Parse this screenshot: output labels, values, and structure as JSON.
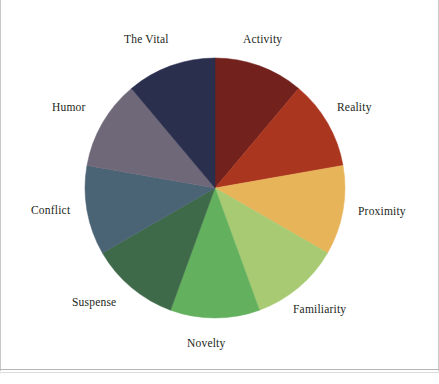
{
  "page": {
    "background_color": "#ffffff",
    "border_color": "#c9c9c9"
  },
  "chart_data": {
    "type": "pie",
    "title": "",
    "subtitle": "",
    "xlabel": "",
    "ylabel": "",
    "legend_position": "labels-around-pie",
    "grid": false,
    "start_angle_deg": 0,
    "direction": "clockwise",
    "equal_slices": true,
    "slice_angle_deg": 40,
    "center": {
      "x": 215,
      "y": 188
    },
    "radius": 130,
    "categories": [
      "Activity",
      "Reality",
      "Proximity",
      "Familiarity",
      "Novelty",
      "Suspense",
      "Conflict",
      "Humor",
      "The Vital"
    ],
    "values": [
      11.11,
      11.11,
      11.11,
      11.11,
      11.11,
      11.11,
      11.11,
      11.11,
      11.11
    ],
    "colors": [
      "#73211c",
      "#ab3620",
      "#e8b45a",
      "#a8ca72",
      "#63b05e",
      "#3e6a4a",
      "#4a6375",
      "#6e6878",
      "#2b2f4e"
    ],
    "slices": [
      {
        "label": "Activity",
        "color": "#73211c",
        "start_deg": 0,
        "end_deg": 40,
        "value": 11.11
      },
      {
        "label": "Reality",
        "color": "#ab3620",
        "start_deg": 40,
        "end_deg": 80,
        "value": 11.11
      },
      {
        "label": "Proximity",
        "color": "#e8b45a",
        "start_deg": 80,
        "end_deg": 120,
        "value": 11.11
      },
      {
        "label": "Familiarity",
        "color": "#a8ca72",
        "start_deg": 120,
        "end_deg": 160,
        "value": 11.11
      },
      {
        "label": "Novelty",
        "color": "#63b05e",
        "start_deg": 160,
        "end_deg": 200,
        "value": 11.11
      },
      {
        "label": "Suspense",
        "color": "#3e6a4a",
        "start_deg": 200,
        "end_deg": 240,
        "value": 11.11
      },
      {
        "label": "Conflict",
        "color": "#4a6375",
        "start_deg": 240,
        "end_deg": 280,
        "value": 11.11
      },
      {
        "label": "Humor",
        "color": "#6e6878",
        "start_deg": 280,
        "end_deg": 320,
        "value": 11.11
      },
      {
        "label": "The Vital",
        "color": "#2b2f4e",
        "start_deg": 320,
        "end_deg": 360,
        "value": 11.11
      }
    ]
  },
  "labels": {
    "activity": "Activity",
    "reality": "Reality",
    "proximity": "Proximity",
    "familiarity": "Familiarity",
    "novelty": "Novelty",
    "suspense": "Suspense",
    "conflict": "Conflict",
    "humor": "Humor",
    "the_vital": "The Vital"
  }
}
